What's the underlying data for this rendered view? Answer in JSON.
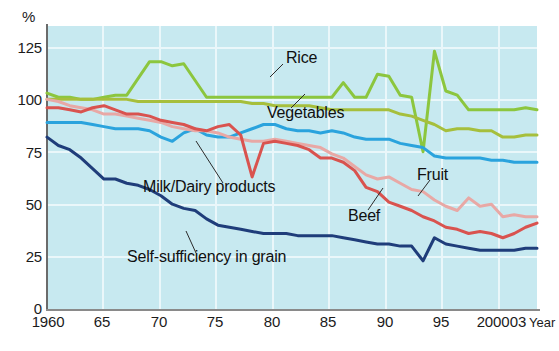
{
  "chart_data": {
    "type": "line",
    "title": "",
    "subtitle": "",
    "xlabel": "Year",
    "ylabel": "%",
    "ylim": [
      0,
      135
    ],
    "xlim": [
      1960,
      2003
    ],
    "grid": true,
    "legend_position": "inline-annotations",
    "background_color": "#c7e9f0",
    "ytick_labels": [
      "0",
      "25",
      "50",
      "75",
      "100",
      "125"
    ],
    "ytick_values": [
      0,
      25,
      50,
      75,
      100,
      125
    ],
    "xtick_labels": [
      "1960",
      "65",
      "70",
      "75",
      "80",
      "85",
      "90",
      "95",
      "2000",
      "03"
    ],
    "xtick_values": [
      1960,
      1965,
      1970,
      1975,
      1980,
      1985,
      1990,
      1995,
      2000,
      2003
    ],
    "x": [
      1960,
      1961,
      1962,
      1963,
      1964,
      1965,
      1966,
      1967,
      1968,
      1969,
      1970,
      1971,
      1972,
      1973,
      1974,
      1975,
      1976,
      1977,
      1978,
      1979,
      1980,
      1981,
      1982,
      1983,
      1984,
      1985,
      1986,
      1987,
      1988,
      1989,
      1990,
      1991,
      1992,
      1993,
      1994,
      1995,
      1996,
      1997,
      1998,
      1999,
      2000,
      2001,
      2002,
      2003
    ],
    "series": [
      {
        "name": "Rice",
        "color": "#8cc63e",
        "label_x": 1980,
        "label_y": 113,
        "values": [
          103,
          101,
          101,
          100,
          100,
          101,
          102,
          102,
          110,
          118,
          118,
          116,
          117,
          109,
          101,
          101,
          101,
          101,
          101,
          101,
          101,
          101,
          101,
          101,
          101,
          101,
          108,
          101,
          101,
          112,
          111,
          102,
          101,
          75,
          123,
          104,
          102,
          95,
          95,
          95,
          95,
          95,
          96,
          95
        ]
      },
      {
        "name": "Vegetables",
        "color": "#a6bf3c",
        "label_x": 1981,
        "label_y": 93,
        "values": [
          100,
          100,
          100,
          100,
          100,
          100,
          100,
          100,
          99,
          99,
          99,
          99,
          99,
          99,
          99,
          99,
          99,
          99,
          98,
          98,
          97,
          97,
          97,
          97,
          96,
          95,
          95,
          95,
          95,
          95,
          95,
          93,
          92,
          90,
          88,
          85,
          86,
          86,
          85,
          85,
          82,
          82,
          83,
          83
        ]
      },
      {
        "name": "Milk/Dairy products",
        "color": "#2aa3dd",
        "label_x": 1968,
        "label_y": 61,
        "values": [
          89,
          89,
          89,
          89,
          88,
          87,
          86,
          86,
          86,
          85,
          82,
          80,
          84,
          86,
          83,
          82,
          82,
          84,
          86,
          88,
          88,
          86,
          85,
          85,
          84,
          85,
          84,
          82,
          81,
          81,
          81,
          79,
          78,
          77,
          73,
          72,
          72,
          72,
          72,
          71,
          71,
          70,
          70,
          70
        ]
      },
      {
        "name": "Fruit",
        "color": "#e8a8a5",
        "label_x": 1996,
        "label_y": 65,
        "values": [
          100,
          99,
          97,
          96,
          95,
          93,
          93,
          92,
          91,
          90,
          89,
          87,
          86,
          85,
          85,
          84,
          82,
          81,
          80,
          80,
          81,
          80,
          79,
          78,
          77,
          74,
          72,
          68,
          64,
          62,
          63,
          60,
          57,
          56,
          52,
          49,
          47,
          53,
          49,
          50,
          44,
          45,
          44,
          44
        ]
      },
      {
        "name": "Beef",
        "color": "#d9534f",
        "label_x": 1987,
        "label_y": 49,
        "values": [
          96,
          96,
          95,
          94,
          96,
          97,
          95,
          93,
          93,
          92,
          90,
          89,
          88,
          86,
          85,
          87,
          88,
          83,
          63,
          79,
          80,
          79,
          78,
          76,
          72,
          72,
          70,
          66,
          58,
          56,
          51,
          49,
          47,
          44,
          42,
          39,
          38,
          36,
          37,
          36,
          34,
          36,
          39,
          41
        ]
      },
      {
        "name": "Self-sufficiency in grain",
        "color": "#1f3d7a",
        "label_x": 1973,
        "label_y": 28,
        "values": [
          82,
          78,
          76,
          72,
          67,
          62,
          62,
          60,
          59,
          57,
          54,
          50,
          48,
          47,
          43,
          40,
          39,
          38,
          37,
          36,
          36,
          36,
          35,
          35,
          35,
          35,
          34,
          33,
          32,
          31,
          31,
          30,
          30,
          23,
          34,
          31,
          30,
          29,
          28,
          28,
          28,
          28,
          29,
          29
        ]
      }
    ],
    "annotations": [
      {
        "text": "Rice",
        "x": 286,
        "y": 57
      },
      {
        "text": "Vegetables",
        "x": 267,
        "y": 112
      },
      {
        "text": "Milk/Dairy products",
        "x": 143,
        "y": 186
      },
      {
        "text": "Fruit",
        "x": 417,
        "y": 174
      },
      {
        "text": "Beef",
        "x": 348,
        "y": 215
      },
      {
        "text": "Self-sufficiency in grain",
        "x": 127,
        "y": 256
      }
    ],
    "leader_lines": [
      {
        "from": [
          283,
          64
        ],
        "to": [
          270,
          77
        ]
      },
      {
        "from": [
          291,
          108
        ],
        "to": [
          305,
          94
        ]
      },
      {
        "from": [
          223,
          183
        ],
        "to": [
          196,
          141
        ]
      },
      {
        "from": [
          430,
          180
        ],
        "to": [
          418,
          196
        ]
      },
      {
        "from": [
          368,
          210
        ],
        "to": [
          383,
          188
        ]
      },
      {
        "from": [
          196,
          253
        ],
        "to": [
          186,
          231
        ]
      }
    ]
  },
  "axis": {
    "unit_label": "%",
    "year_suffix": "Year"
  }
}
